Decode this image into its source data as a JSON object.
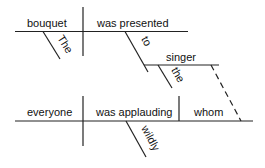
{
  "diagram": {
    "type": "sentence-diagram",
    "main_clause": {
      "subject": "bouquet",
      "subject_modifier": "The",
      "verb": "was presented",
      "prepositional_phrase": {
        "preposition": "to",
        "object": "singer",
        "object_modifier": "the"
      }
    },
    "relative_clause": {
      "subject": "everyone",
      "verb": "was applauding",
      "object": "whom",
      "verb_modifier": "wildly"
    },
    "connector": "dashed line from singer to whom"
  },
  "colors": {
    "line": "#222222",
    "text": "#111111",
    "background": "#ffffff"
  }
}
